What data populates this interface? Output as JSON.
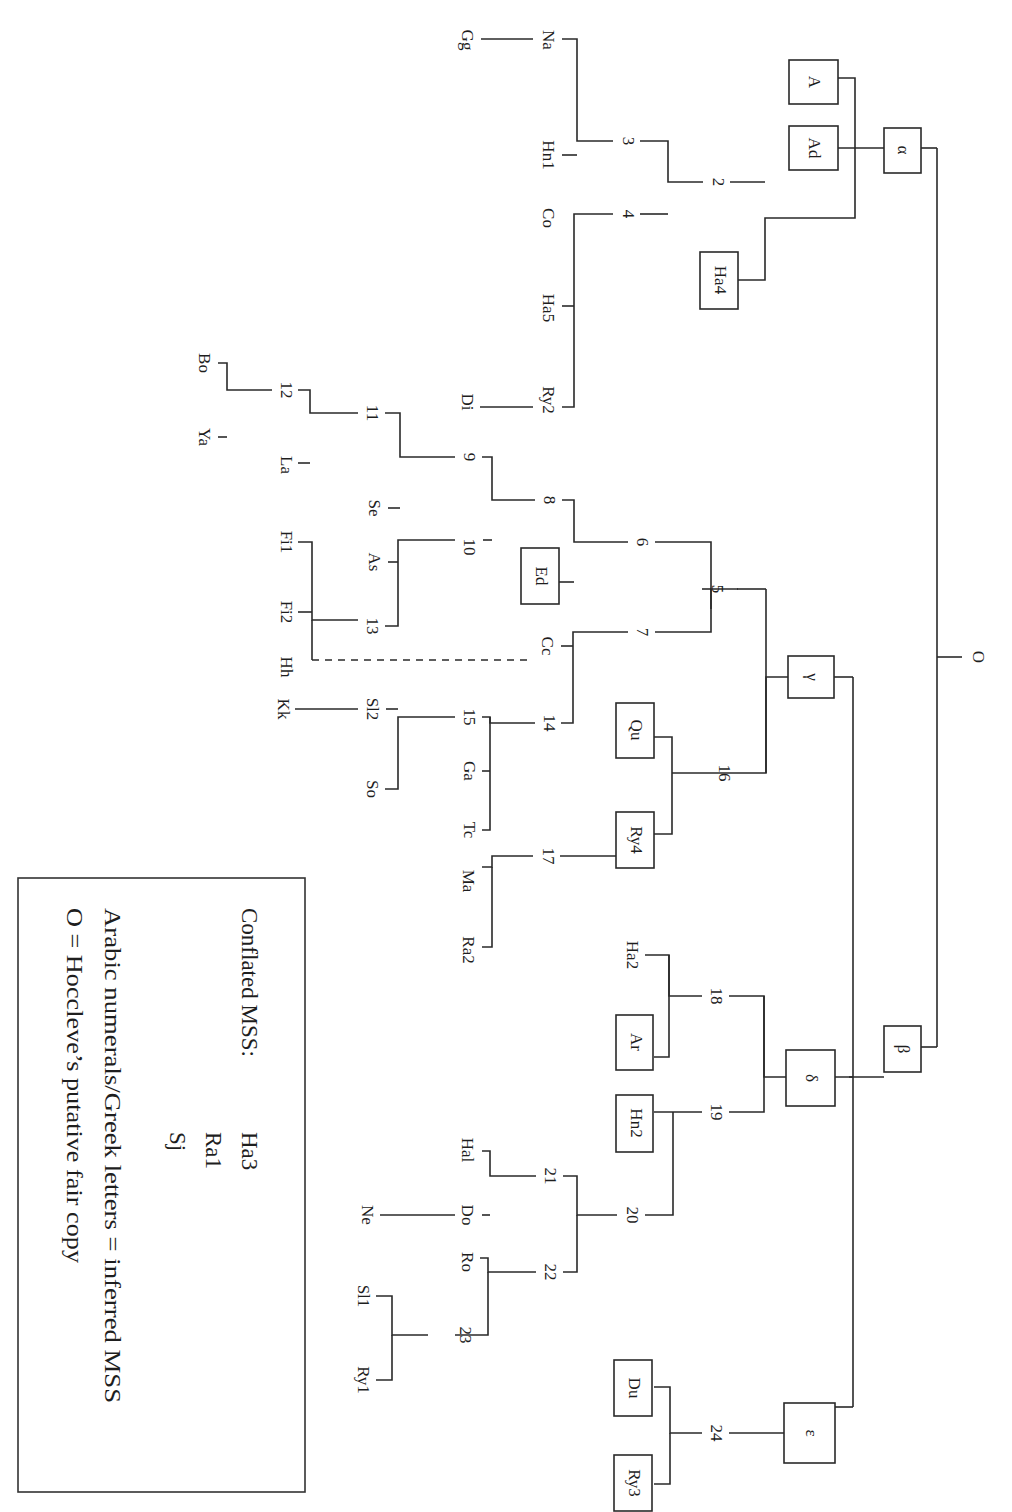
{
  "figure": {
    "type": "stemma codicum",
    "orientation": "rotated 90 degrees clockwise",
    "root": {
      "id": "O",
      "label": "O"
    },
    "colors": {
      "line": "#2a2a2a",
      "text": "#1e1e1e",
      "background": "#ffffff"
    }
  },
  "nodes": {
    "O": "O",
    "alpha": "α",
    "beta": "β",
    "gamma": "γ",
    "delta": "δ",
    "epsilon": "ε",
    "n2": "2",
    "n3": "3",
    "n4": "4",
    "n5": "5",
    "n6": "6",
    "n7": "7",
    "n8": "8",
    "n9": "9",
    "n10": "10",
    "n11": "11",
    "n12": "12",
    "n13": "13",
    "n14": "14",
    "n15": "15",
    "n16": "16",
    "n17": "17",
    "n18": "18",
    "n19": "19",
    "n20": "20",
    "n21": "21",
    "n22": "22",
    "n23": "23",
    "n24": "24",
    "A": "A",
    "Ad": "Ad",
    "Ha4": "Ha4",
    "Na": "Na",
    "Gg": "Gg",
    "Hn1": "Hn1",
    "Co": "Co",
    "Ha5": "Ha5",
    "Ry2": "Ry2",
    "Di": "Di",
    "Bo": "Bo",
    "Ya": "Ya",
    "La": "La",
    "Se": "Se",
    "As": "As",
    "Fi1": "Fi1",
    "Fi2": "Fi2",
    "Hh": "Hh",
    "Ed": "Ed",
    "Cc": "Cc",
    "Sl2": "Sl2",
    "Kk": "Kk",
    "So": "So",
    "Ga": "Ga",
    "Tc": "Tc",
    "Qu": "Qu",
    "Ry4": "Ry4",
    "Ma": "Ma",
    "Ra2": "Ra2",
    "Ha2": "Ha2",
    "Ar": "Ar",
    "Hn2": "Hn2",
    "Hal": "Hal",
    "Do": "Do",
    "Ne": "Ne",
    "Ro": "Ro",
    "Sl1": "Sl1",
    "Ry1": "Ry1",
    "Du": "Du",
    "Ry3": "Ry3"
  },
  "edges": [
    [
      "O",
      "alpha"
    ],
    [
      "O",
      "beta"
    ],
    [
      "alpha",
      "A"
    ],
    [
      "alpha",
      "Ad"
    ],
    [
      "alpha",
      "2"
    ],
    [
      "2",
      "3"
    ],
    [
      "2",
      "4"
    ],
    [
      "2",
      "Ha4"
    ],
    [
      "3",
      "Na"
    ],
    [
      "3",
      "Hn1"
    ],
    [
      "Na",
      "Gg"
    ],
    [
      "4",
      "Co"
    ],
    [
      "4",
      "Ha5"
    ],
    [
      "4",
      "Ry2"
    ],
    [
      "Ry2",
      "Di"
    ],
    [
      "beta",
      "gamma"
    ],
    [
      "beta",
      "delta"
    ],
    [
      "beta",
      "epsilon"
    ],
    [
      "gamma",
      "5"
    ],
    [
      "gamma",
      "16"
    ],
    [
      "5",
      "6"
    ],
    [
      "5",
      "7"
    ],
    [
      "6",
      "8"
    ],
    [
      "6",
      "Ed"
    ],
    [
      "8",
      "9"
    ],
    [
      "8",
      "10"
    ],
    [
      "9",
      "11"
    ],
    [
      "9",
      "Se"
    ],
    [
      "11",
      "12"
    ],
    [
      "11",
      "La"
    ],
    [
      "12",
      "Bo"
    ],
    [
      "12",
      "Ya"
    ],
    [
      "10",
      "As"
    ],
    [
      "10",
      "13"
    ],
    [
      "13",
      "Fi1"
    ],
    [
      "13",
      "Fi2"
    ],
    [
      "13",
      "Hh"
    ],
    [
      "7",
      "Cc"
    ],
    [
      "7",
      "14"
    ],
    [
      "14",
      "15"
    ],
    [
      "14",
      "Ga"
    ],
    [
      "14",
      "Tc"
    ],
    [
      "15",
      "Sl2"
    ],
    [
      "15",
      "So"
    ],
    [
      "Sl2",
      "Kk"
    ],
    [
      "16",
      "Qu"
    ],
    [
      "16",
      "Ry4"
    ],
    [
      "Ry4",
      "17"
    ],
    [
      "17",
      "Ma"
    ],
    [
      "17",
      "Ra2"
    ],
    [
      "delta",
      "18"
    ],
    [
      "delta",
      "19"
    ],
    [
      "18",
      "Ha2"
    ],
    [
      "18",
      "Ar"
    ],
    [
      "19",
      "Hn2"
    ],
    [
      "Hn2",
      "20"
    ],
    [
      "20",
      "21"
    ],
    [
      "20",
      "22"
    ],
    [
      "21",
      "Hal"
    ],
    [
      "21",
      "Do"
    ],
    [
      "Do",
      "Ne"
    ],
    [
      "22",
      "Ro"
    ],
    [
      "22",
      "23"
    ],
    [
      "23",
      "Sl1"
    ],
    [
      "23",
      "Ry1"
    ],
    [
      "epsilon",
      "24"
    ],
    [
      "24",
      "Du"
    ],
    [
      "24",
      "Ry3"
    ]
  ],
  "contamination_edges": [
    [
      "Cc",
      "Hh"
    ]
  ],
  "boxed_nodes": [
    "A",
    "Ad",
    "alpha",
    "Ha4",
    "Ed",
    "gamma",
    "Qu",
    "Ry4",
    "Ar",
    "Hn2",
    "delta",
    "beta",
    "Du",
    "Ry3",
    "epsilon"
  ],
  "legend": {
    "conflated_label": "Conflated MSS:",
    "conflated_mss": [
      "Ha3",
      "Ra1",
      "Sj"
    ],
    "line2": "Arabic numerals/Greek letters = inferred MSS",
    "line3": "O =  Hoccleve’s putative fair copy"
  }
}
